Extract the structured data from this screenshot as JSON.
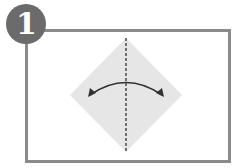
{
  "diagram": {
    "type": "origami-instruction-step",
    "step": {
      "number": "1",
      "badge_color": "#6b6b6b"
    },
    "frame": {
      "border_color": "#8a8a8a"
    },
    "paper": {
      "shape": "diamond",
      "fill_color": "#e6e6e6"
    },
    "fold_line": {
      "style": "dashed",
      "orientation": "vertical",
      "color": "#333333"
    },
    "arrow": {
      "style": "double-headed curved",
      "meaning": "fold and unfold",
      "color": "#333333"
    }
  }
}
